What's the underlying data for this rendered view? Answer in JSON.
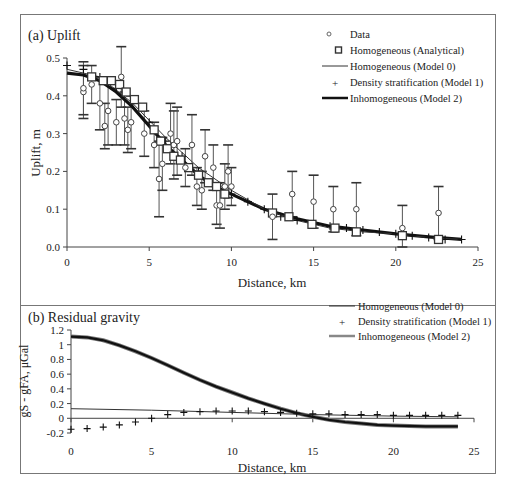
{
  "chart_data": [
    {
      "panel": "a",
      "type": "scatter",
      "title": "(a) Uplift",
      "xlabel": "Distance, km",
      "ylabel": "Uplift, m",
      "xlim": [
        0,
        25
      ],
      "ylim": [
        0,
        0.5
      ],
      "xticks": [
        "0",
        "5",
        "10",
        "15",
        "20",
        "25"
      ],
      "yticks": [
        "0.0",
        "0.1",
        "0.2",
        "0.3",
        "0.4",
        "0.5"
      ],
      "grid": false,
      "legend_position": "top-right",
      "legend": [
        {
          "label": "Data",
          "marker": "circle"
        },
        {
          "label": "Homogeneous (Analytical)",
          "marker": "square"
        },
        {
          "label": "Homogeneous (Model 0)",
          "marker": "thin-line"
        },
        {
          "label": "Density stratification (Model 1)",
          "marker": "plus"
        },
        {
          "label": "Inhomogeneous (Model 2)",
          "marker": "thick-line"
        }
      ],
      "series": [
        {
          "name": "Data",
          "type": "scatter-errorbar",
          "points": [
            {
              "x": 1.0,
              "y": 0.41,
              "err": 0.07
            },
            {
              "x": 1.0,
              "y": 0.42,
              "err": 0.07
            },
            {
              "x": 1.5,
              "y": 0.43,
              "err": 0.05
            },
            {
              "x": 2.0,
              "y": 0.38,
              "err": 0.07
            },
            {
              "x": 2.3,
              "y": 0.32,
              "err": 0.06
            },
            {
              "x": 2.5,
              "y": 0.36,
              "err": 0.09
            },
            {
              "x": 3.0,
              "y": 0.33,
              "err": 0.06
            },
            {
              "x": 3.3,
              "y": 0.45,
              "err": 0.08
            },
            {
              "x": 3.5,
              "y": 0.34,
              "err": 0.07
            },
            {
              "x": 3.7,
              "y": 0.31,
              "err": 0.06
            },
            {
              "x": 3.9,
              "y": 0.33,
              "err": 0.07
            },
            {
              "x": 4.7,
              "y": 0.3,
              "err": 0.06
            },
            {
              "x": 5.3,
              "y": 0.27,
              "err": 0.06
            },
            {
              "x": 5.6,
              "y": 0.18,
              "err": 0.1
            },
            {
              "x": 5.8,
              "y": 0.22,
              "err": 0.07
            },
            {
              "x": 6.3,
              "y": 0.3,
              "err": 0.08
            },
            {
              "x": 6.5,
              "y": 0.27,
              "err": 0.09
            },
            {
              "x": 6.7,
              "y": 0.28,
              "err": 0.09
            },
            {
              "x": 7.2,
              "y": 0.21,
              "err": 0.05
            },
            {
              "x": 7.6,
              "y": 0.27,
              "err": 0.08
            },
            {
              "x": 7.9,
              "y": 0.16,
              "err": 0.05
            },
            {
              "x": 8.2,
              "y": 0.15,
              "err": 0.05
            },
            {
              "x": 8.4,
              "y": 0.24,
              "err": 0.07
            },
            {
              "x": 8.9,
              "y": 0.21,
              "err": 0.06
            },
            {
              "x": 9.1,
              "y": 0.11,
              "err": 0.05
            },
            {
              "x": 9.3,
              "y": 0.11,
              "err": 0.06
            },
            {
              "x": 9.6,
              "y": 0.16,
              "err": 0.06
            },
            {
              "x": 9.8,
              "y": 0.2,
              "err": 0.07
            },
            {
              "x": 10.0,
              "y": 0.16,
              "err": 0.05
            },
            {
              "x": 12.5,
              "y": 0.08,
              "err": 0.06
            },
            {
              "x": 13.7,
              "y": 0.14,
              "err": 0.06
            },
            {
              "x": 15.0,
              "y": 0.12,
              "err": 0.07
            },
            {
              "x": 16.2,
              "y": 0.1,
              "err": 0.06
            },
            {
              "x": 17.6,
              "y": 0.1,
              "err": 0.07
            },
            {
              "x": 20.4,
              "y": 0.05,
              "err": 0.06
            },
            {
              "x": 22.6,
              "y": 0.09,
              "err": 0.07
            }
          ]
        },
        {
          "name": "Homogeneous (Analytical)",
          "type": "scatter",
          "x": [
            1.5,
            2.2,
            2.7,
            3.2,
            3.6,
            4.1,
            4.6,
            5.3,
            5.7,
            6.1,
            6.5,
            6.9,
            7.4,
            8.0,
            8.6,
            9.1,
            9.6,
            12.5,
            13.5,
            14.9,
            16.3,
            17.6,
            20.4,
            22.6
          ],
          "y": [
            0.45,
            0.44,
            0.44,
            0.43,
            0.41,
            0.39,
            0.37,
            0.31,
            0.28,
            0.26,
            0.24,
            0.23,
            0.21,
            0.19,
            0.17,
            0.16,
            0.14,
            0.09,
            0.08,
            0.06,
            0.05,
            0.04,
            0.03,
            0.02
          ]
        },
        {
          "name": "Homogeneous (Model 0)",
          "type": "line",
          "x": [
            0,
            2,
            4,
            6,
            8,
            10,
            12,
            14,
            16,
            18,
            20,
            22,
            24
          ],
          "y": [
            0.47,
            0.45,
            0.38,
            0.29,
            0.21,
            0.15,
            0.1,
            0.07,
            0.05,
            0.04,
            0.035,
            0.025,
            0.02
          ]
        },
        {
          "name": "Density stratification (Model 1)",
          "type": "scatter",
          "x": [
            0,
            1,
            2,
            3,
            4,
            5,
            6,
            7,
            8,
            9,
            10,
            11,
            12,
            13,
            14,
            15,
            16,
            17,
            18,
            19,
            20,
            21,
            22,
            23,
            24
          ],
          "y": [
            0.48,
            0.47,
            0.45,
            0.42,
            0.38,
            0.33,
            0.28,
            0.24,
            0.2,
            0.16,
            0.14,
            0.12,
            0.1,
            0.08,
            0.07,
            0.06,
            0.055,
            0.05,
            0.045,
            0.04,
            0.035,
            0.03,
            0.025,
            0.02,
            0.02
          ]
        },
        {
          "name": "Inhomogeneous (Model 2)",
          "type": "line",
          "x": [
            0,
            1,
            2,
            3,
            4,
            5,
            6,
            7,
            8,
            9,
            10,
            12,
            14,
            16,
            18,
            20,
            22,
            24
          ],
          "y": [
            0.46,
            0.455,
            0.44,
            0.41,
            0.37,
            0.32,
            0.27,
            0.23,
            0.19,
            0.16,
            0.14,
            0.1,
            0.075,
            0.055,
            0.045,
            0.035,
            0.027,
            0.02
          ]
        }
      ]
    },
    {
      "panel": "b",
      "type": "line",
      "title": "(b) Residual gravity",
      "xlabel": "Distance, km",
      "ylabel": "gS - gFA, μGal",
      "xlim": [
        0,
        25
      ],
      "ylim": [
        -0.2,
        1.2
      ],
      "xticks": [
        "0",
        "5",
        "10",
        "15",
        "20",
        "25"
      ],
      "yticks": [
        "1.2",
        "1",
        "0.8",
        "0.6",
        "0.4",
        "0.2",
        "0",
        "-0.2"
      ],
      "grid": false,
      "legend_position": "top-right",
      "legend": [
        {
          "label": "Homogeneous (Model 0)",
          "marker": "thin-line"
        },
        {
          "label": "Density stratification (Model 1)",
          "marker": "plus"
        },
        {
          "label": "Inhomogeneous (Model 2)",
          "marker": "thick-gray-line"
        }
      ],
      "series": [
        {
          "name": "Homogeneous (Model 0)",
          "type": "line",
          "x": [
            0,
            5,
            10,
            15,
            20,
            24
          ],
          "y": [
            0.13,
            0.11,
            0.08,
            0.05,
            0.03,
            0.02
          ]
        },
        {
          "name": "Density stratification (Model 1)",
          "type": "scatter",
          "x": [
            0,
            1,
            2,
            3,
            4,
            5,
            6,
            7,
            8,
            9,
            10,
            11,
            12,
            13,
            14,
            15,
            16,
            17,
            18,
            19,
            20,
            21,
            22,
            23,
            24
          ],
          "y": [
            -0.15,
            -0.14,
            -0.12,
            -0.09,
            -0.05,
            0.0,
            0.05,
            0.08,
            0.09,
            0.1,
            0.1,
            0.1,
            0.09,
            0.08,
            0.07,
            0.06,
            0.06,
            0.05,
            0.05,
            0.05,
            0.04,
            0.04,
            0.04,
            0.04,
            0.04
          ]
        },
        {
          "name": "Inhomogeneous (Model 2)",
          "type": "line",
          "x": [
            0,
            1,
            2,
            3,
            4,
            5,
            6,
            7,
            8,
            9,
            10,
            11,
            12,
            13,
            14,
            15,
            16,
            17,
            18,
            19,
            20,
            22,
            24
          ],
          "y": [
            1.11,
            1.1,
            1.06,
            0.99,
            0.91,
            0.82,
            0.72,
            0.62,
            0.52,
            0.43,
            0.35,
            0.27,
            0.2,
            0.13,
            0.07,
            0.02,
            -0.02,
            -0.05,
            -0.07,
            -0.09,
            -0.1,
            -0.11,
            -0.11
          ]
        }
      ]
    }
  ],
  "labels": {
    "a_title": "(a) Uplift",
    "b_title": "(b) Residual gravity",
    "a_xlabel": "Distance, km",
    "b_xlabel": "Distance, km",
    "a_ylabel": "Uplift, m",
    "b_ylabel": "gS - gFA, μGal",
    "legend_a": [
      "Data",
      "Homogeneous (Analytical)",
      "Homogeneous (Model 0)",
      "Density stratification (Model 1)",
      "Inhomogeneous (Model 2)"
    ],
    "legend_b": [
      "Homogeneous (Model 0)",
      "Density stratification (Model 1)",
      "Inhomogeneous (Model 2)"
    ]
  }
}
